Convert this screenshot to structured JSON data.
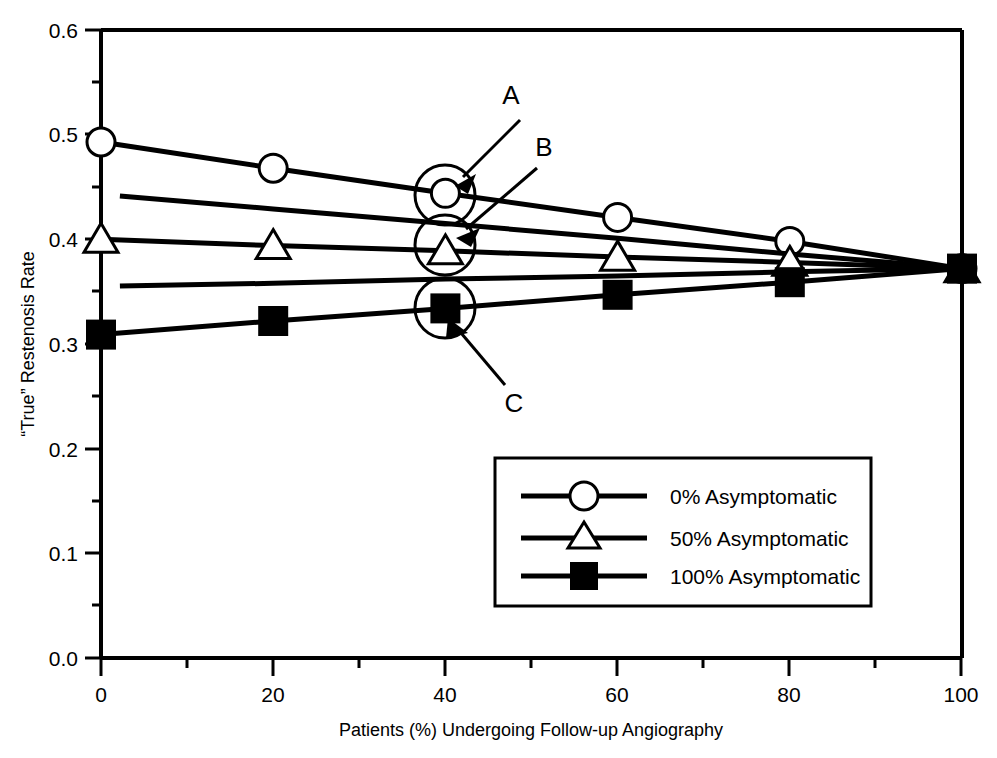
{
  "chart_data": {
    "type": "line",
    "title": "",
    "subtitle": "",
    "xlabel": "Patients (%) Undergoing Follow-up Angiography",
    "ylabel": "“True” Restenosis Rate",
    "xlim": [
      0,
      100
    ],
    "ylim": [
      0.0,
      0.6
    ],
    "grid": false,
    "legend_position": "inside lower-center-right",
    "x_ticks": [
      0,
      20,
      40,
      60,
      80,
      100
    ],
    "x_tick_labels": [
      "0",
      "20",
      "40",
      "60",
      "80",
      "100"
    ],
    "x_minor_ticks": [
      10,
      30,
      50,
      70,
      90
    ],
    "y_ticks": [
      0.0,
      0.1,
      0.2,
      0.3,
      0.4,
      0.5,
      0.6
    ],
    "y_tick_labels": [
      "0.0",
      "0.1",
      "0.2",
      "0.3",
      "0.4",
      "0.5",
      "0.6"
    ],
    "y_minor_ticks": [
      0.05,
      0.15,
      0.25,
      0.35,
      0.45,
      0.55
    ],
    "x": [
      0,
      20,
      40,
      60,
      80,
      100
    ],
    "series": [
      {
        "name": "0% Asymptomatic",
        "marker": "open-circle",
        "values": [
          0.493,
          0.468,
          0.444,
          0.421,
          0.398,
          0.372
        ],
        "has_markers": true
      },
      {
        "name": "25% Asymptomatic (unlabeled)",
        "marker": "none",
        "values": [
          0.443,
          0.429,
          0.415,
          0.401,
          0.386,
          0.372
        ],
        "has_markers": false
      },
      {
        "name": "50% Asymptomatic",
        "marker": "open-triangle",
        "values": [
          0.4,
          0.394,
          0.389,
          0.383,
          0.378,
          0.372
        ],
        "has_markers": true
      },
      {
        "name": "75% Asymptomatic (unlabeled)",
        "marker": "none",
        "values": [
          0.355,
          0.358,
          0.362,
          0.365,
          0.369,
          0.372
        ],
        "has_markers": false
      },
      {
        "name": "100% Asymptomatic",
        "marker": "filled-square",
        "values": [
          0.309,
          0.322,
          0.334,
          0.347,
          0.359,
          0.372
        ],
        "has_markers": true
      }
    ],
    "annotations": [
      {
        "label": "A",
        "points_to_series": "0% Asymptomatic",
        "points_to_x": 40,
        "points_to_y": 0.444,
        "circled": true
      },
      {
        "label": "B",
        "points_to_series": "50% Asymptomatic",
        "points_to_x": 40,
        "points_to_y": 0.389,
        "circled": true
      },
      {
        "label": "C",
        "points_to_series": "100% Asymptomatic",
        "points_to_x": 40,
        "points_to_y": 0.334,
        "circled": true
      }
    ]
  },
  "legend": {
    "entries": [
      {
        "label": "0% Asymptomatic",
        "marker": "open-circle"
      },
      {
        "label": "50% Asymptomatic",
        "marker": "open-triangle"
      },
      {
        "label": "100% Asymptomatic",
        "marker": "filled-square"
      }
    ]
  },
  "colors": {
    "line": "#000000",
    "axis": "#000000",
    "background": "#ffffff",
    "marker_fill_open": "#ffffff",
    "marker_fill_solid": "#000000"
  },
  "axis": {
    "x_title": "Patients (%) Undergoing Follow-up Angiography",
    "y_title": "“True” Restenosis Rate"
  },
  "annotation_labels": {
    "a": "A",
    "b": "B",
    "c": "C"
  },
  "tick_text": {
    "y0": "0.0",
    "y1": "0.1",
    "y2": "0.2",
    "y3": "0.3",
    "y4": "0.4",
    "y5": "0.5",
    "y6": "0.6",
    "x0": "0",
    "x1": "20",
    "x2": "40",
    "x3": "60",
    "x4": "80",
    "x5": "100"
  }
}
